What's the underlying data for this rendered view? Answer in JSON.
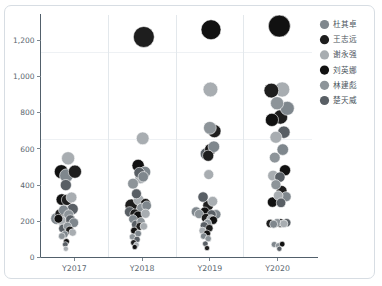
{
  "chart_data": {
    "type": "scatter",
    "title": "",
    "subtitle": "",
    "xlabel": "",
    "ylabel": "",
    "categories": [
      "Y2017",
      "Y2018",
      "Y2019",
      "Y2020"
    ],
    "xtick_labels": [
      "Y2017",
      "Y2018",
      "Y2019",
      "Y2020"
    ],
    "ytick_labels": [
      "0",
      "200",
      "400",
      "600",
      "800",
      "1,000",
      "1,200"
    ],
    "ytick_values": [
      0,
      200,
      400,
      600,
      800,
      1000,
      1200
    ],
    "ylim": [
      0,
      1320
    ],
    "grid": true,
    "legend_position": "right",
    "marker_shape": "circle",
    "series": [
      {
        "name": "杜其卓",
        "color": "#7f878d"
      },
      {
        "name": "王志远",
        "color": "#1e1e1e"
      },
      {
        "name": "谢永强",
        "color": "#a8adb1"
      },
      {
        "name": "刘英娜",
        "color": "#111111"
      },
      {
        "name": "林建彪",
        "color": "#8d9499"
      },
      {
        "name": "楚天威",
        "color": "#595f65"
      }
    ],
    "points": [
      {
        "cat": "Y2017",
        "series": "杜其卓",
        "jitter": -0.62,
        "y": 215,
        "size": 6.0
      },
      {
        "cat": "Y2017",
        "series": "林建彪",
        "jitter": -0.4,
        "y": 196,
        "size": 5.2
      },
      {
        "cat": "Y2017",
        "series": "谢永强",
        "jitter": -0.22,
        "y": 548,
        "size": 6.6
      },
      {
        "cat": "Y2017",
        "series": "杜其卓",
        "jitter": -0.28,
        "y": 452,
        "size": 6.8
      },
      {
        "cat": "Y2017",
        "series": "刘英娜",
        "jitter": -0.46,
        "y": 474,
        "size": 7.0
      },
      {
        "cat": "Y2017",
        "series": "王志远",
        "jitter": 0.02,
        "y": 474,
        "size": 6.6
      },
      {
        "cat": "Y2017",
        "series": "楚天威",
        "jitter": -0.3,
        "y": 400,
        "size": 5.6
      },
      {
        "cat": "Y2017",
        "series": "刘英娜",
        "jitter": -0.44,
        "y": 320,
        "size": 5.8
      },
      {
        "cat": "Y2017",
        "series": "王志远",
        "jitter": -0.26,
        "y": 318,
        "size": 5.6
      },
      {
        "cat": "Y2017",
        "series": "谢永强",
        "jitter": -0.1,
        "y": 332,
        "size": 5.4
      },
      {
        "cat": "Y2017",
        "series": "楚天威",
        "jitter": -0.06,
        "y": 268,
        "size": 5.6
      },
      {
        "cat": "Y2017",
        "series": "杜其卓",
        "jitter": -0.38,
        "y": 262,
        "size": 5.0
      },
      {
        "cat": "Y2017",
        "series": "王志远",
        "jitter": -0.5,
        "y": 240,
        "size": 5.2
      },
      {
        "cat": "Y2017",
        "series": "林建彪",
        "jitter": -0.2,
        "y": 236,
        "size": 5.0
      },
      {
        "cat": "Y2017",
        "series": "刘英娜",
        "jitter": -0.3,
        "y": 222,
        "size": 5.4
      },
      {
        "cat": "Y2017",
        "series": "谢永强",
        "jitter": -0.46,
        "y": 206,
        "size": 4.6
      },
      {
        "cat": "Y2017",
        "series": "楚天威",
        "jitter": -0.14,
        "y": 208,
        "size": 5.0
      },
      {
        "cat": "Y2017",
        "series": "王志远",
        "jitter": -0.34,
        "y": 190,
        "size": 5.2
      },
      {
        "cat": "Y2017",
        "series": "杜其卓",
        "jitter": -0.02,
        "y": 192,
        "size": 4.8
      },
      {
        "cat": "Y2017",
        "series": "刘英娜",
        "jitter": -0.56,
        "y": 214,
        "size": 4.4
      },
      {
        "cat": "Y2017",
        "series": "林建彪",
        "jitter": -0.24,
        "y": 172,
        "size": 4.2
      },
      {
        "cat": "Y2017",
        "series": "楚天威",
        "jitter": -0.4,
        "y": 160,
        "size": 4.4
      },
      {
        "cat": "Y2017",
        "series": "王志远",
        "jitter": -0.16,
        "y": 150,
        "size": 4.2
      },
      {
        "cat": "Y2017",
        "series": "谢永强",
        "jitter": -0.06,
        "y": 138,
        "size": 3.8
      },
      {
        "cat": "Y2017",
        "series": "杜其卓",
        "jitter": -0.34,
        "y": 128,
        "size": 3.6
      },
      {
        "cat": "Y2017",
        "series": "林建彪",
        "jitter": -0.44,
        "y": 118,
        "size": 3.4
      },
      {
        "cat": "Y2017",
        "series": "刘英娜",
        "jitter": -0.28,
        "y": 88,
        "size": 3.0
      },
      {
        "cat": "Y2017",
        "series": "楚天威",
        "jitter": -0.32,
        "y": 72,
        "size": 2.8
      },
      {
        "cat": "Y2017",
        "series": "谢永强",
        "jitter": -0.3,
        "y": 48,
        "size": 2.6
      },
      {
        "cat": "Y2018",
        "series": "王志远",
        "jitter": 0.06,
        "y": 1218,
        "size": 10.5
      },
      {
        "cat": "Y2018",
        "series": "谢永强",
        "jitter": 0.02,
        "y": 658,
        "size": 6.4
      },
      {
        "cat": "Y2018",
        "series": "刘英娜",
        "jitter": -0.14,
        "y": 508,
        "size": 6.2
      },
      {
        "cat": "Y2018",
        "series": "楚天威",
        "jitter": -0.1,
        "y": 468,
        "size": 5.4
      },
      {
        "cat": "Y2018",
        "series": "杜其卓",
        "jitter": 0.1,
        "y": 472,
        "size": 5.8
      },
      {
        "cat": "Y2018",
        "series": "林建彪",
        "jitter": -0.32,
        "y": 408,
        "size": 5.4
      },
      {
        "cat": "Y2018",
        "series": "谢永强",
        "jitter": -0.06,
        "y": 438,
        "size": 5.6
      },
      {
        "cat": "Y2018",
        "series": "杜其卓",
        "jitter": 0.04,
        "y": 446,
        "size": 5.2
      },
      {
        "cat": "Y2018",
        "series": "楚天威",
        "jitter": -0.2,
        "y": 352,
        "size": 5.0
      },
      {
        "cat": "Y2018",
        "series": "王志远",
        "jitter": -0.38,
        "y": 288,
        "size": 6.4
      },
      {
        "cat": "Y2018",
        "series": "谢永强",
        "jitter": -0.12,
        "y": 318,
        "size": 5.4
      },
      {
        "cat": "Y2018",
        "series": "刘英娜",
        "jitter": 0.12,
        "y": 298,
        "size": 5.0
      },
      {
        "cat": "Y2018",
        "series": "杜其卓",
        "jitter": 0.16,
        "y": 286,
        "size": 4.8
      },
      {
        "cat": "Y2018",
        "series": "林建彪",
        "jitter": -0.02,
        "y": 272,
        "size": 5.0
      },
      {
        "cat": "Y2018",
        "series": "楚天威",
        "jitter": -0.44,
        "y": 252,
        "size": 5.2
      },
      {
        "cat": "Y2018",
        "series": "王志远",
        "jitter": -0.26,
        "y": 242,
        "size": 4.8
      },
      {
        "cat": "Y2018",
        "series": "谢永强",
        "jitter": 0.12,
        "y": 242,
        "size": 4.6
      },
      {
        "cat": "Y2018",
        "series": "刘英娜",
        "jitter": -0.14,
        "y": 230,
        "size": 4.8
      },
      {
        "cat": "Y2018",
        "series": "杜其卓",
        "jitter": -0.32,
        "y": 212,
        "size": 4.4
      },
      {
        "cat": "Y2018",
        "series": "林建彪",
        "jitter": -0.04,
        "y": 198,
        "size": 4.2
      },
      {
        "cat": "Y2018",
        "series": "楚天威",
        "jitter": -0.22,
        "y": 182,
        "size": 4.4
      },
      {
        "cat": "Y2018",
        "series": "王志远",
        "jitter": -0.08,
        "y": 172,
        "size": 4.0
      },
      {
        "cat": "Y2018",
        "series": "谢永强",
        "jitter": 0.06,
        "y": 172,
        "size": 3.8
      },
      {
        "cat": "Y2018",
        "series": "刘英娜",
        "jitter": -0.28,
        "y": 148,
        "size": 3.6
      },
      {
        "cat": "Y2018",
        "series": "杜其卓",
        "jitter": -0.14,
        "y": 132,
        "size": 3.4
      },
      {
        "cat": "Y2018",
        "series": "林建彪",
        "jitter": -0.34,
        "y": 114,
        "size": 3.2
      },
      {
        "cat": "Y2018",
        "series": "楚天威",
        "jitter": -0.18,
        "y": 100,
        "size": 3.2
      },
      {
        "cat": "Y2018",
        "series": "王志远",
        "jitter": -0.3,
        "y": 82,
        "size": 3.0
      },
      {
        "cat": "Y2018",
        "series": "谢永强",
        "jitter": -0.2,
        "y": 70,
        "size": 2.8
      },
      {
        "cat": "Y2018",
        "series": "刘英娜",
        "jitter": -0.26,
        "y": 58,
        "size": 2.6
      },
      {
        "cat": "Y2019",
        "series": "刘英娜",
        "jitter": 0.04,
        "y": 1258,
        "size": 10.0
      },
      {
        "cat": "Y2019",
        "series": "谢永强",
        "jitter": 0.02,
        "y": 928,
        "size": 7.4
      },
      {
        "cat": "Y2019",
        "series": "林建彪",
        "jitter": 0.0,
        "y": 716,
        "size": 6.4
      },
      {
        "cat": "Y2019",
        "series": "王志远",
        "jitter": 0.16,
        "y": 698,
        "size": 6.6
      },
      {
        "cat": "Y2019",
        "series": "楚天威",
        "jitter": -0.12,
        "y": 572,
        "size": 6.2
      },
      {
        "cat": "Y2019",
        "series": "刘英娜",
        "jitter": 0.02,
        "y": 598,
        "size": 5.8
      },
      {
        "cat": "Y2019",
        "series": "王志远",
        "jitter": -0.06,
        "y": 562,
        "size": 5.6
      },
      {
        "cat": "Y2019",
        "series": "杜其卓",
        "jitter": 0.14,
        "y": 612,
        "size": 5.8
      },
      {
        "cat": "Y2019",
        "series": "谢永强",
        "jitter": -0.04,
        "y": 458,
        "size": 5.0
      },
      {
        "cat": "Y2019",
        "series": "楚天威",
        "jitter": -0.24,
        "y": 334,
        "size": 5.2
      },
      {
        "cat": "Y2019",
        "series": "王志远",
        "jitter": -0.06,
        "y": 288,
        "size": 5.4
      },
      {
        "cat": "Y2019",
        "series": "谢永强",
        "jitter": 0.1,
        "y": 310,
        "size": 5.0
      },
      {
        "cat": "Y2019",
        "series": "杜其卓",
        "jitter": -0.48,
        "y": 252,
        "size": 5.0
      },
      {
        "cat": "Y2019",
        "series": "林建彪",
        "jitter": -0.38,
        "y": 240,
        "size": 4.6
      },
      {
        "cat": "Y2019",
        "series": "刘英娜",
        "jitter": -0.18,
        "y": 252,
        "size": 4.8
      },
      {
        "cat": "Y2019",
        "series": "楚天威",
        "jitter": 0.06,
        "y": 238,
        "size": 4.6
      },
      {
        "cat": "Y2019",
        "series": "杜其卓",
        "jitter": 0.22,
        "y": 238,
        "size": 4.8
      },
      {
        "cat": "Y2019",
        "series": "王志远",
        "jitter": -0.14,
        "y": 218,
        "size": 4.6
      },
      {
        "cat": "Y2019",
        "series": "谢永强",
        "jitter": 0.04,
        "y": 212,
        "size": 4.4
      },
      {
        "cat": "Y2019",
        "series": "刘英娜",
        "jitter": 0.12,
        "y": 206,
        "size": 4.2
      },
      {
        "cat": "Y2019",
        "series": "林建彪",
        "jitter": -0.08,
        "y": 190,
        "size": 4.0
      },
      {
        "cat": "Y2019",
        "series": "楚天威",
        "jitter": -0.2,
        "y": 176,
        "size": 4.0
      },
      {
        "cat": "Y2019",
        "series": "王志远",
        "jitter": -0.02,
        "y": 162,
        "size": 3.8
      },
      {
        "cat": "Y2019",
        "series": "谢永强",
        "jitter": -0.26,
        "y": 148,
        "size": 3.6
      },
      {
        "cat": "Y2019",
        "series": "刘英娜",
        "jitter": -0.1,
        "y": 132,
        "size": 3.6
      },
      {
        "cat": "Y2019",
        "series": "杜其卓",
        "jitter": -0.22,
        "y": 118,
        "size": 3.2
      },
      {
        "cat": "Y2019",
        "series": "林建彪",
        "jitter": -0.06,
        "y": 104,
        "size": 3.2
      },
      {
        "cat": "Y2019",
        "series": "楚天威",
        "jitter": -0.16,
        "y": 76,
        "size": 2.8
      },
      {
        "cat": "Y2019",
        "series": "王志远",
        "jitter": -0.1,
        "y": 52,
        "size": 2.6
      },
      {
        "cat": "Y2020",
        "series": "刘英娜",
        "jitter": 0.06,
        "y": 1278,
        "size": 11.0
      },
      {
        "cat": "Y2020",
        "series": "王志远",
        "jitter": -0.22,
        "y": 922,
        "size": 7.4
      },
      {
        "cat": "Y2020",
        "series": "谢永强",
        "jitter": 0.16,
        "y": 928,
        "size": 7.6
      },
      {
        "cat": "Y2020",
        "series": "林建彪",
        "jitter": -0.02,
        "y": 852,
        "size": 6.6
      },
      {
        "cat": "Y2020",
        "series": "杜其卓",
        "jitter": 0.34,
        "y": 824,
        "size": 7.0
      },
      {
        "cat": "Y2020",
        "series": "刘英娜",
        "jitter": -0.2,
        "y": 760,
        "size": 6.6
      },
      {
        "cat": "Y2020",
        "series": "王志远",
        "jitter": 0.1,
        "y": 776,
        "size": 7.2
      },
      {
        "cat": "Y2020",
        "series": "楚天威",
        "jitter": 0.22,
        "y": 692,
        "size": 6.2
      },
      {
        "cat": "Y2020",
        "series": "谢永强",
        "jitter": -0.06,
        "y": 664,
        "size": 6.0
      },
      {
        "cat": "Y2020",
        "series": "杜其卓",
        "jitter": 0.18,
        "y": 596,
        "size": 5.8
      },
      {
        "cat": "Y2020",
        "series": "林建彪",
        "jitter": -0.1,
        "y": 552,
        "size": 5.4
      },
      {
        "cat": "Y2020",
        "series": "刘英娜",
        "jitter": 0.26,
        "y": 482,
        "size": 5.6
      },
      {
        "cat": "Y2020",
        "series": "谢永强",
        "jitter": -0.16,
        "y": 452,
        "size": 5.4
      },
      {
        "cat": "Y2020",
        "series": "楚天威",
        "jitter": 0.08,
        "y": 444,
        "size": 5.2
      },
      {
        "cat": "Y2020",
        "series": "王志远",
        "jitter": 0.14,
        "y": 368,
        "size": 5.4
      },
      {
        "cat": "Y2020",
        "series": "林建彪",
        "jitter": -0.06,
        "y": 402,
        "size": 5.0
      },
      {
        "cat": "Y2020",
        "series": "杜其卓",
        "jitter": 0.3,
        "y": 336,
        "size": 5.0
      },
      {
        "cat": "Y2020",
        "series": "刘英娜",
        "jitter": -0.18,
        "y": 306,
        "size": 5.2
      },
      {
        "cat": "Y2020",
        "series": "谢永强",
        "jitter": 0.02,
        "y": 342,
        "size": 4.8
      },
      {
        "cat": "Y2020",
        "series": "楚天威",
        "jitter": 0.12,
        "y": 302,
        "size": 4.8
      },
      {
        "cat": "Y2020",
        "series": "王志远",
        "jitter": -0.26,
        "y": 188,
        "size": 4.2
      },
      {
        "cat": "Y2020",
        "series": "杜其卓",
        "jitter": -0.14,
        "y": 184,
        "size": 4.0
      },
      {
        "cat": "Y2020",
        "series": "林建彪",
        "jitter": -0.02,
        "y": 192,
        "size": 4.2
      },
      {
        "cat": "Y2020",
        "series": "刘英娜",
        "jitter": 0.1,
        "y": 190,
        "size": 4.4
      },
      {
        "cat": "Y2020",
        "series": "谢永强",
        "jitter": 0.22,
        "y": 186,
        "size": 4.0
      },
      {
        "cat": "Y2020",
        "series": "楚天威",
        "jitter": 0.32,
        "y": 192,
        "size": 4.2
      },
      {
        "cat": "Y2020",
        "series": "杜其卓",
        "jitter": -0.12,
        "y": 72,
        "size": 3.0
      },
      {
        "cat": "Y2020",
        "series": "林建彪",
        "jitter": 0.02,
        "y": 66,
        "size": 2.8
      },
      {
        "cat": "Y2020",
        "series": "刘英娜",
        "jitter": 0.16,
        "y": 74,
        "size": 2.8
      },
      {
        "cat": "Y2020",
        "series": "楚天威",
        "jitter": 0.06,
        "y": 48,
        "size": 2.6
      }
    ]
  },
  "legend": {
    "entries": [
      {
        "label": "杜其卓",
        "color": "#7f878d"
      },
      {
        "label": "王志远",
        "color": "#1e1e1e"
      },
      {
        "label": "谢永强",
        "color": "#a8adb1"
      },
      {
        "label": "刘英娜",
        "color": "#111111"
      },
      {
        "label": "林建彪",
        "color": "#8d9499"
      },
      {
        "label": "楚天威",
        "color": "#595f65"
      }
    ]
  },
  "colors": {
    "background": "#ffffff",
    "frame_border": "#d7dde3",
    "axis": "#52606b",
    "gridline": "#eef1f4",
    "panel_separator": "#e3e8ec",
    "tick_text": "#5b6770",
    "legend_text": "#4a545c"
  }
}
